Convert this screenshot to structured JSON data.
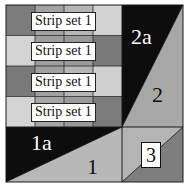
{
  "diagram": {
    "type": "quilt-block-piecing-diagram",
    "colors": {
      "background": "#ffffff",
      "outline": "#1a1a1a",
      "black": "#0d0d0d",
      "dark_gray": "#7a7a7a",
      "mid_gray": "#9c9c9c",
      "light_gray": "#c4c4c4",
      "pale_gray": "#d6d6d6"
    },
    "strip_rows": [
      {
        "label": "Strip set 1",
        "cells": [
          "#7c7c7c",
          "#a2a2a2",
          "#b5b5b5",
          "#d2d2d2"
        ]
      },
      {
        "label": "Strip set 1",
        "cells": [
          "#d4d4d4",
          "#9e9e9e",
          "#9a9a9a",
          "#7a7a7a"
        ]
      },
      {
        "label": "Strip set 1",
        "cells": [
          "#7a7a7a",
          "#a0a0a0",
          "#b6b6b6",
          "#d0d0d0"
        ]
      },
      {
        "label": "Strip set 1",
        "cells": [
          "#d4d4d4",
          "#a6a6a6",
          "#9a9a9a",
          "#7c7c7c"
        ]
      }
    ],
    "pieces": {
      "p2a": "2a",
      "p2": "2",
      "p1a": "1a",
      "p1": "1",
      "p3": "3"
    }
  }
}
